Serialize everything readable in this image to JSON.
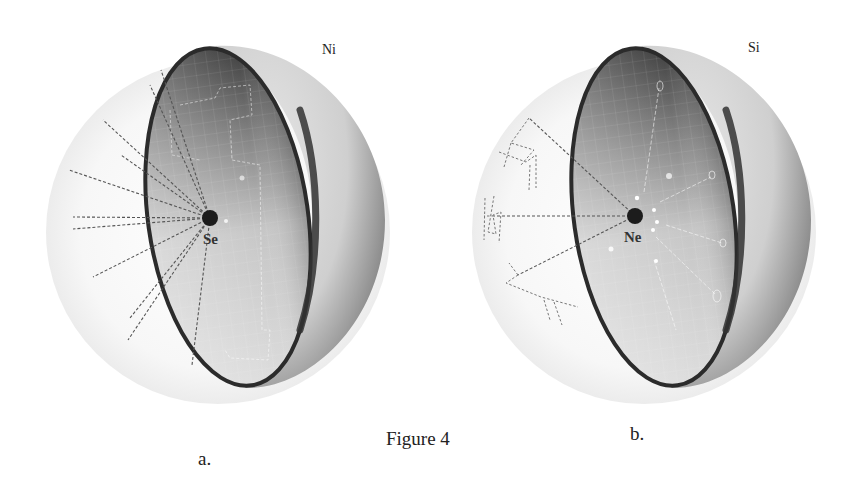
{
  "figure": {
    "caption": "Figure 4",
    "panels": [
      {
        "id": "a",
        "label": "a.",
        "corner_label": "Ni",
        "center_label": "Se",
        "description": "Cut-away celestial hemisphere with a dark central point and dashed rays radiating outward to the left"
      },
      {
        "id": "b",
        "label": "b.",
        "corner_label": "Si",
        "center_label": "Ne",
        "description": "Cut-away celestial hemisphere with a dark central point, dashed rays to constellation figures, and small bright star points"
      }
    ]
  },
  "colors": {
    "background": "#ffffff",
    "rim": "#2b2b2b",
    "inner_dark": "#3a3a3a",
    "inner_light": "#d8d8d8",
    "outer_shell": "#cfcfcf",
    "ghost_sphere": "#f2f2f2",
    "center_dot": "#1c1c1c",
    "dashed_ray": "#555555"
  }
}
